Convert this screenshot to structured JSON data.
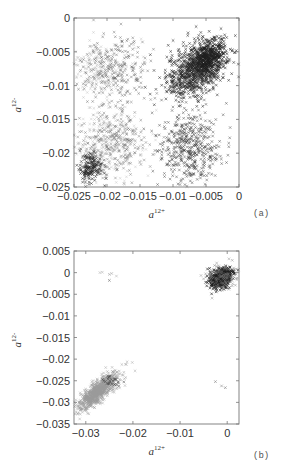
{
  "chart_data": [
    {
      "id": "a",
      "type": "scatter",
      "panel_label": "(a)",
      "title": "",
      "xlabel": "a",
      "xlabel_sup": "12+",
      "ylabel": "a",
      "ylabel_sup": "12-",
      "xlim": [
        -0.025,
        0
      ],
      "ylim": [
        -0.025,
        0
      ],
      "xticks": [
        -0.025,
        -0.02,
        -0.015,
        -0.01,
        -0.005,
        0
      ],
      "xtick_labels": [
        "−0.025",
        "−0.02",
        "−0.015",
        "−0.01",
        "−0.005",
        "0"
      ],
      "yticks": [
        0,
        -0.005,
        -0.01,
        -0.015,
        -0.02,
        -0.025
      ],
      "ytick_labels": [
        "0",
        "−0.005",
        "−0.01",
        "−0.015",
        "−0.02",
        "−0.025"
      ],
      "grid": false,
      "legend": null,
      "marker": "x",
      "frame_px": {
        "left": 74,
        "top": 18,
        "right": 239,
        "bottom": 187
      },
      "clusters": [
        {
          "name": "upper-right dense",
          "cx": -0.0065,
          "cy": -0.0075,
          "sx": 0.0022,
          "sy": 0.0022,
          "corr": 0.45,
          "n": 900,
          "color": "#2a2a2a",
          "opacity": 0.75
        },
        {
          "name": "upper-right core",
          "cx": -0.0045,
          "cy": -0.006,
          "sx": 0.0013,
          "sy": 0.0013,
          "corr": 0.3,
          "n": 350,
          "color": "#1e1e1e",
          "opacity": 0.8
        },
        {
          "name": "upper-left sparse",
          "cx": -0.019,
          "cy": -0.0075,
          "sx": 0.0028,
          "sy": 0.0022,
          "corr": 0.0,
          "n": 260,
          "color": "#555555",
          "opacity": 0.55
        },
        {
          "name": "upper-left faint",
          "cx": -0.021,
          "cy": -0.008,
          "sx": 0.0025,
          "sy": 0.0025,
          "corr": 0.0,
          "n": 200,
          "color": "#aaaaaa",
          "opacity": 0.45
        },
        {
          "name": "lower-right sparse",
          "cx": -0.0075,
          "cy": -0.019,
          "sx": 0.0024,
          "sy": 0.0028,
          "corr": 0.0,
          "n": 480,
          "color": "#3a3a3a",
          "opacity": 0.6
        },
        {
          "name": "lower-left sparse",
          "cx": -0.019,
          "cy": -0.0185,
          "sx": 0.0028,
          "sy": 0.0026,
          "corr": 0.0,
          "n": 300,
          "color": "#666666",
          "opacity": 0.55
        },
        {
          "name": "lower-left faint",
          "cx": -0.02,
          "cy": -0.019,
          "sx": 0.003,
          "sy": 0.003,
          "corr": 0.0,
          "n": 220,
          "color": "#b0b0b0",
          "opacity": 0.45
        },
        {
          "name": "lower-left dense",
          "cx": -0.0225,
          "cy": -0.022,
          "sx": 0.0009,
          "sy": 0.0009,
          "corr": 0.0,
          "n": 180,
          "color": "#2a2a2a",
          "opacity": 0.75
        }
      ]
    },
    {
      "id": "b",
      "type": "scatter",
      "panel_label": "(b)",
      "title": "",
      "xlabel": "a",
      "xlabel_sup": "12+",
      "ylabel": "a",
      "ylabel_sup": "12-",
      "xlim": [
        -0.0325,
        0.0025
      ],
      "ylim": [
        -0.035,
        0.005
      ],
      "xticks": [
        -0.03,
        -0.02,
        -0.01,
        0
      ],
      "xtick_labels": [
        "−0.03",
        "−0.02",
        "−0.01",
        "0"
      ],
      "yticks": [
        0.005,
        0,
        -0.005,
        -0.01,
        -0.015,
        -0.02,
        -0.025,
        -0.03,
        -0.035
      ],
      "ytick_labels": [
        "0.005",
        "0",
        "−0.005",
        "−0.01",
        "−0.015",
        "−0.02",
        "−0.025",
        "−0.03",
        "−0.035"
      ],
      "grid": false,
      "legend": null,
      "marker": "x",
      "frame_px": {
        "left": 74,
        "top": 251,
        "right": 239,
        "bottom": 424
      },
      "clusters": [
        {
          "name": "upper-right dense",
          "cx": -0.0013,
          "cy": -0.0013,
          "sx": 0.0011,
          "sy": 0.0011,
          "corr": 0.3,
          "n": 600,
          "color": "#1e1e1e",
          "opacity": 0.85
        },
        {
          "name": "upper-right halo",
          "cx": -0.0012,
          "cy": -0.0012,
          "sx": 0.0018,
          "sy": 0.0017,
          "corr": 0.2,
          "n": 120,
          "color": "#777777",
          "opacity": 0.55
        },
        {
          "name": "lower-left elongated",
          "cx": -0.0275,
          "cy": -0.0275,
          "sx": 0.0022,
          "sy": 0.0022,
          "corr": 0.82,
          "n": 900,
          "color": "#9a9a9a",
          "opacity": 0.6
        },
        {
          "name": "lower-left dark spots",
          "cx": -0.0245,
          "cy": -0.025,
          "sx": 0.0009,
          "sy": 0.0007,
          "corr": 0.0,
          "n": 25,
          "color": "#444444",
          "opacity": 0.7
        }
      ],
      "isolated_points": [
        {
          "x": -0.027,
          "y": 0.0,
          "color": "#bbbbbb"
        },
        {
          "x": -0.0265,
          "y": 0.0001,
          "color": "#bbbbbb"
        },
        {
          "x": -0.025,
          "y": -0.0004,
          "color": "#aaaaaa"
        },
        {
          "x": -0.0245,
          "y": -0.0002,
          "color": "#aaaaaa"
        },
        {
          "x": -0.025,
          "y": -0.0018,
          "color": "#777777"
        },
        {
          "x": -0.0235,
          "y": -0.0008,
          "color": "#bbbbbb"
        },
        {
          "x": -0.0025,
          "y": -0.0252,
          "color": "#888888"
        },
        {
          "x": -0.0012,
          "y": -0.0262,
          "color": "#999999"
        },
        {
          "x": -0.0004,
          "y": -0.0266,
          "color": "#888888"
        }
      ]
    }
  ]
}
